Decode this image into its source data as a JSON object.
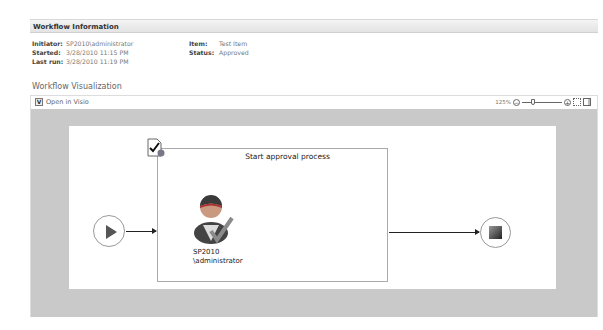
{
  "workflow_information": {
    "header": "Workflow Information",
    "fields_left": [
      {
        "label": "Initiator:",
        "value": "SP2010\\administrator"
      },
      {
        "label": "Started:",
        "value": "3/28/2010 11:15 PM"
      },
      {
        "label": "Last run:",
        "value": "3/28/2010 11:19 PM"
      }
    ],
    "fields_right": [
      {
        "label": "Item:",
        "value": "Test Item"
      },
      {
        "label": "Status:",
        "value": "Approved"
      }
    ]
  },
  "visualization": {
    "title": "Workflow Visualization",
    "toolbar": {
      "open_in_visio": "Open in Visio",
      "zoom_level": "125%",
      "zoom_out_icon": "minus-circle-icon",
      "zoom_in_icon": "plus-circle-icon",
      "fit_icon": "fit-page-icon",
      "panel_icon": "toggle-panel-icon"
    },
    "diagram": {
      "start_node": "start-icon",
      "step_title": "Start approval process",
      "step_icon": "approval-task-icon",
      "assignee": "SP2010\n\\administrator",
      "end_node": "stop-icon"
    }
  }
}
